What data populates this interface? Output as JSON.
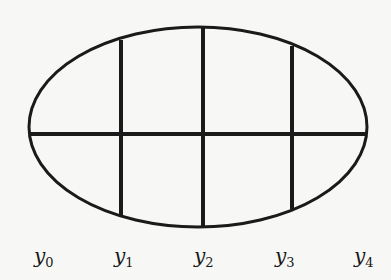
{
  "diagram": {
    "shape": "ellipse",
    "ellipse": {
      "cx": 198,
      "cy": 127,
      "rx": 169,
      "ry": 100
    },
    "horizontal_axis": {
      "y": 134,
      "x1": 29,
      "x2": 366
    },
    "vertical_chords": [
      {
        "x": 121,
        "y_top": 40,
        "y_bottom": 215
      },
      {
        "x": 203,
        "y_top": 28,
        "y_bottom": 227
      },
      {
        "x": 292,
        "y_top": 46,
        "y_bottom": 209
      }
    ],
    "stroke_color": "#1a1a1a",
    "labels": [
      {
        "var": "y",
        "sub": "0",
        "x": 34
      },
      {
        "var": "y",
        "sub": "1",
        "x": 114
      },
      {
        "var": "y",
        "sub": "2",
        "x": 194
      },
      {
        "var": "y",
        "sub": "3",
        "x": 275
      },
      {
        "var": "y",
        "sub": "4",
        "x": 354
      }
    ]
  }
}
